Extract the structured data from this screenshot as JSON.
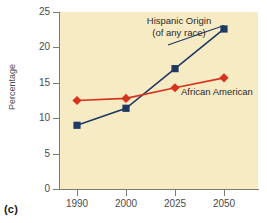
{
  "figure": {
    "caption": "(c)"
  },
  "chart_data": {
    "type": "line",
    "title": "",
    "subtitle": "",
    "xlabel": "",
    "ylabel": "Percentage",
    "categories": [
      "1990",
      "2000",
      "2025",
      "2050"
    ],
    "x": [
      1990,
      2000,
      2025,
      2050
    ],
    "xtick_labels": [
      "1990",
      "2000",
      "2025",
      "2050"
    ],
    "ytick_labels": [
      "0",
      "5",
      "10",
      "15",
      "20",
      "25"
    ],
    "ytick_values": [
      0,
      5,
      10,
      15,
      20,
      25
    ],
    "ylim": [
      0,
      25
    ],
    "grid": false,
    "legend_position": "inline-annotations",
    "plot_background": "#f7ebc4",
    "series": [
      {
        "name": "Hispanic Origin",
        "annotation_line1": "Hispanic Origin",
        "annotation_line2": "(of any race)",
        "color": "#1f3864",
        "marker": "square",
        "values": [
          9.0,
          11.4,
          17.0,
          22.6
        ]
      },
      {
        "name": "African American",
        "annotation_line1": "African American",
        "annotation_line2": "",
        "color": "#d6321e",
        "marker": "diamond",
        "values": [
          12.5,
          12.8,
          14.3,
          15.7
        ]
      }
    ]
  }
}
